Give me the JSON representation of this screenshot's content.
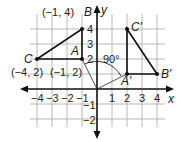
{
  "diagram": {
    "type": "coordinate-plane-rotation",
    "axes": {
      "x_label": "x",
      "y_label": "y"
    },
    "x_ticks": [
      "−4",
      "−3",
      "−2",
      "−1",
      "1",
      "2",
      "3",
      "4"
    ],
    "y_ticks": [
      "4",
      "3",
      "2",
      "−1",
      "−2"
    ],
    "angle_label": "90°",
    "triangle_original": {
      "A": {
        "name": "A",
        "coord": "(−1, 2)"
      },
      "B": {
        "name": "B",
        "coord": "(−1, 4)"
      },
      "C": {
        "name": "C",
        "coord": "(−4, 2)"
      }
    },
    "triangle_image": {
      "A": {
        "name": "A′"
      },
      "B": {
        "name": "B′"
      },
      "C": {
        "name": "C′"
      }
    },
    "colors": {
      "grid": "#b8b8b8",
      "lines": "#111111",
      "text": "#222222"
    }
  }
}
